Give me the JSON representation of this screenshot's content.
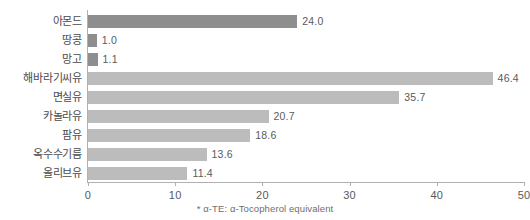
{
  "chart_data": {
    "type": "bar",
    "orientation": "horizontal",
    "title": "",
    "xlabel": "",
    "ylabel": "",
    "xlim": [
      0,
      50
    ],
    "xticks": [
      "0",
      "10",
      "20",
      "30",
      "40",
      "50"
    ],
    "grid": false,
    "legend": "none",
    "categories": [
      "아몬드",
      "땅콩",
      "망고",
      "해바라기씨유",
      "면실유",
      "카놀라유",
      "팜유",
      "옥수수기름",
      "올리브유"
    ],
    "values": [
      24.0,
      1.0,
      1.1,
      46.4,
      35.7,
      20.7,
      18.6,
      13.6,
      11.4
    ],
    "value_labels": [
      "24.0",
      "1.0",
      "1.1",
      "46.4",
      "35.7",
      "20.7",
      "18.6",
      "13.6",
      "11.4"
    ],
    "bar_colors": [
      "#8e8e8e",
      "#8e8e8e",
      "#8e8e8e",
      "#bcbcbc",
      "#bcbcbc",
      "#bcbcbc",
      "#bcbcbc",
      "#bcbcbc",
      "#bcbcbc"
    ],
    "annotations": [
      "* α-TE: α-Tocopherol equivalent"
    ]
  },
  "footnote": "* α-TE: α-Tocopherol equivalent",
  "colors": {
    "bar_dark": "#8e8e8e",
    "bar_light": "#bcbcbc",
    "axis": "#b0b0b0",
    "text": "#4a4a4a",
    "background": "#ffffff"
  }
}
